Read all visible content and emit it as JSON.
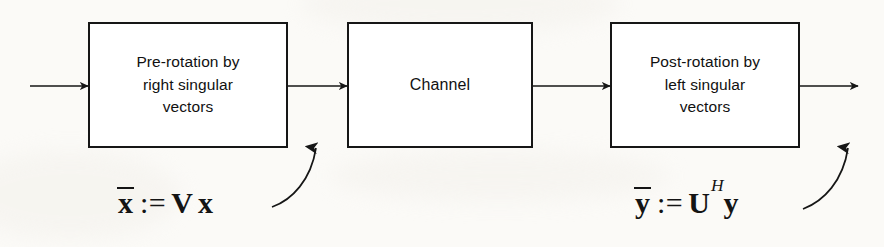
{
  "diagram": {
    "background_color": "#fbfaf7",
    "line_color": "#161616",
    "blocks": [
      {
        "id": "pre-rotation",
        "label": "Pre-rotation by\nright singular\nvectors",
        "x": 88,
        "y": 22,
        "width": 200,
        "height": 126
      },
      {
        "id": "channel",
        "label": "Channel",
        "x": 347,
        "y": 22,
        "width": 186,
        "height": 126
      },
      {
        "id": "post-rotation",
        "label": "Post-rotation by\nleft singular\nvectors",
        "x": 610,
        "y": 22,
        "width": 190,
        "height": 126
      }
    ],
    "signal_arrows": [
      {
        "id": "input-arrow",
        "x1": 30,
        "y1": 86,
        "x2": 88,
        "y2": 86
      },
      {
        "id": "pre-to-channel",
        "x1": 288,
        "y1": 86,
        "x2": 347,
        "y2": 86
      },
      {
        "id": "channel-to-post",
        "x1": 533,
        "y1": 86,
        "x2": 610,
        "y2": 86
      },
      {
        "id": "output-arrow",
        "x1": 800,
        "y1": 86,
        "x2": 858,
        "y2": 86
      }
    ],
    "callout_arrows": [
      {
        "id": "x-bar-callout",
        "path": "M 272,207 C 292,200 311,180 316,148",
        "points_to": "pre-to-channel"
      },
      {
        "id": "y-bar-callout",
        "path": "M 803,209 C 824,201 843,181 848,148",
        "points_to": "output-arrow"
      }
    ],
    "formulas": [
      {
        "id": "x-bar-definition",
        "text": "x̄ := V x",
        "variable": "x",
        "assign": ":=",
        "matrix": "V",
        "operand": "x",
        "superscript": "",
        "x": 118,
        "y": 186
      },
      {
        "id": "y-bar-definition",
        "text": "ȳ := U^H y",
        "variable": "y",
        "assign": ":=",
        "matrix": "U",
        "operand": "y",
        "superscript": "H",
        "x": 635,
        "y": 186
      }
    ]
  }
}
